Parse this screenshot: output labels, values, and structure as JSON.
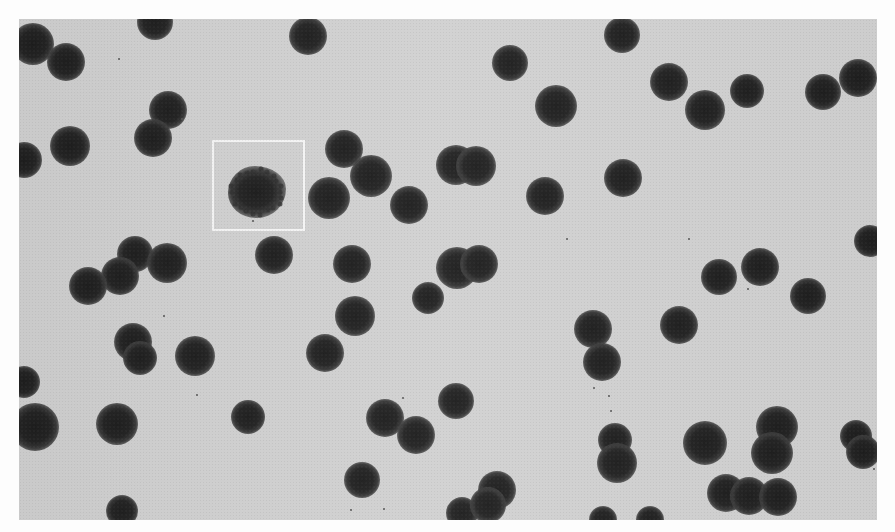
{
  "image": {
    "description": "Grayscale photomicrograph of many dark, round cells scattered on a light gray background; one irregular, spiky cell is enclosed by a white square highlight box.",
    "background_color": "#cfcfcf",
    "border_color": "#fdfdfd",
    "cell_color": "#242424",
    "highlight_box_color": "#f4f4f4",
    "photo_bounds": {
      "x": 19,
      "y": 19,
      "width": 858,
      "height": 501
    },
    "highlight_box": {
      "x": 212,
      "y": 140,
      "width": 93,
      "height": 91
    },
    "atypical_cell": {
      "cx": 257,
      "cy": 192,
      "w": 58,
      "h": 52
    },
    "cells": [
      {
        "cx": 33,
        "cy": 44,
        "r": 17
      },
      {
        "cx": 66,
        "cy": 62,
        "r": 15
      },
      {
        "cx": 155,
        "cy": 22,
        "r": 14
      },
      {
        "cx": 308,
        "cy": 36,
        "r": 15
      },
      {
        "cx": 168,
        "cy": 110,
        "r": 15
      },
      {
        "cx": 153,
        "cy": 138,
        "r": 15
      },
      {
        "cx": 70,
        "cy": 146,
        "r": 16
      },
      {
        "cx": 24,
        "cy": 160,
        "r": 14
      },
      {
        "cx": 71,
        "cy": 137,
        "r": 0
      },
      {
        "cx": 344,
        "cy": 149,
        "r": 15
      },
      {
        "cx": 371,
        "cy": 176,
        "r": 17
      },
      {
        "cx": 329,
        "cy": 198,
        "r": 17
      },
      {
        "cx": 409,
        "cy": 205,
        "r": 15
      },
      {
        "cx": 456,
        "cy": 165,
        "r": 16
      },
      {
        "cx": 476,
        "cy": 166,
        "r": 16
      },
      {
        "cx": 274,
        "cy": 255,
        "r": 15
      },
      {
        "cx": 135,
        "cy": 254,
        "r": 14
      },
      {
        "cx": 120,
        "cy": 276,
        "r": 15
      },
      {
        "cx": 88,
        "cy": 286,
        "r": 15
      },
      {
        "cx": 167,
        "cy": 263,
        "r": 16
      },
      {
        "cx": 352,
        "cy": 264,
        "r": 15
      },
      {
        "cx": 457,
        "cy": 268,
        "r": 17
      },
      {
        "cx": 479,
        "cy": 264,
        "r": 15
      },
      {
        "cx": 428,
        "cy": 298,
        "r": 12
      },
      {
        "cx": 355,
        "cy": 316,
        "r": 16
      },
      {
        "cx": 133,
        "cy": 342,
        "r": 15
      },
      {
        "cx": 140,
        "cy": 358,
        "r": 13
      },
      {
        "cx": 195,
        "cy": 356,
        "r": 16
      },
      {
        "cx": 325,
        "cy": 353,
        "r": 15
      },
      {
        "cx": 24,
        "cy": 382,
        "r": 12
      },
      {
        "cx": 35,
        "cy": 427,
        "r": 20
      },
      {
        "cx": 117,
        "cy": 424,
        "r": 17
      },
      {
        "cx": 248,
        "cy": 417,
        "r": 13
      },
      {
        "cx": 385,
        "cy": 418,
        "r": 15
      },
      {
        "cx": 416,
        "cy": 435,
        "r": 15
      },
      {
        "cx": 456,
        "cy": 401,
        "r": 14
      },
      {
        "cx": 362,
        "cy": 480,
        "r": 14
      },
      {
        "cx": 462,
        "cy": 513,
        "r": 12
      },
      {
        "cx": 497,
        "cy": 490,
        "r": 15
      },
      {
        "cx": 488,
        "cy": 505,
        "r": 14
      },
      {
        "cx": 122,
        "cy": 511,
        "r": 12
      },
      {
        "cx": 510,
        "cy": 63,
        "r": 14
      },
      {
        "cx": 556,
        "cy": 106,
        "r": 17
      },
      {
        "cx": 622,
        "cy": 35,
        "r": 14
      },
      {
        "cx": 669,
        "cy": 82,
        "r": 15
      },
      {
        "cx": 705,
        "cy": 110,
        "r": 16
      },
      {
        "cx": 747,
        "cy": 91,
        "r": 13
      },
      {
        "cx": 823,
        "cy": 92,
        "r": 14
      },
      {
        "cx": 858,
        "cy": 78,
        "r": 15
      },
      {
        "cx": 545,
        "cy": 196,
        "r": 15
      },
      {
        "cx": 623,
        "cy": 178,
        "r": 15
      },
      {
        "cx": 870,
        "cy": 241,
        "r": 12
      },
      {
        "cx": 719,
        "cy": 277,
        "r": 14
      },
      {
        "cx": 760,
        "cy": 267,
        "r": 15
      },
      {
        "cx": 808,
        "cy": 296,
        "r": 14
      },
      {
        "cx": 593,
        "cy": 329,
        "r": 15
      },
      {
        "cx": 602,
        "cy": 362,
        "r": 15
      },
      {
        "cx": 679,
        "cy": 325,
        "r": 15
      },
      {
        "cx": 615,
        "cy": 440,
        "r": 13
      },
      {
        "cx": 617,
        "cy": 463,
        "r": 16
      },
      {
        "cx": 705,
        "cy": 443,
        "r": 18
      },
      {
        "cx": 777,
        "cy": 427,
        "r": 17
      },
      {
        "cx": 772,
        "cy": 453,
        "r": 17
      },
      {
        "cx": 856,
        "cy": 436,
        "r": 12
      },
      {
        "cx": 863,
        "cy": 452,
        "r": 13
      },
      {
        "cx": 726,
        "cy": 493,
        "r": 15
      },
      {
        "cx": 749,
        "cy": 496,
        "r": 15
      },
      {
        "cx": 778,
        "cy": 497,
        "r": 15
      },
      {
        "cx": 603,
        "cy": 520,
        "r": 10
      },
      {
        "cx": 650,
        "cy": 520,
        "r": 10
      }
    ],
    "specks": [
      {
        "x": 118,
        "y": 58
      },
      {
        "x": 181,
        "y": 118
      },
      {
        "x": 252,
        "y": 220
      },
      {
        "x": 163,
        "y": 315
      },
      {
        "x": 196,
        "y": 394
      },
      {
        "x": 402,
        "y": 397
      },
      {
        "x": 350,
        "y": 509
      },
      {
        "x": 383,
        "y": 508
      },
      {
        "x": 747,
        "y": 288
      },
      {
        "x": 610,
        "y": 410
      },
      {
        "x": 608,
        "y": 395
      },
      {
        "x": 688,
        "y": 238
      },
      {
        "x": 566,
        "y": 238
      },
      {
        "x": 873,
        "y": 468
      },
      {
        "x": 593,
        "y": 387
      }
    ]
  }
}
